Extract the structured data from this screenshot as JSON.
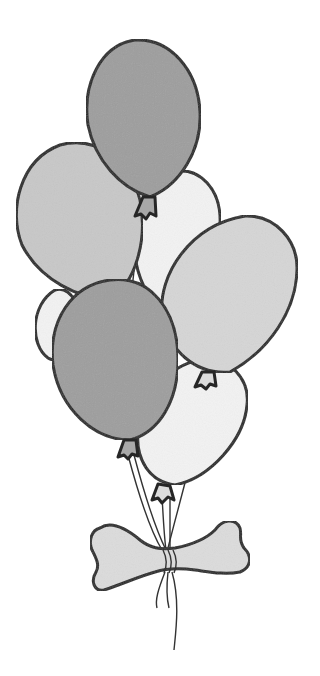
{
  "illustration": {
    "subject": "balloon bunch tied with bone-shaped tag",
    "style": "grayscale watercolor line drawing",
    "colors": {
      "background": "#ffffff",
      "outline": "#262626",
      "dark_balloon": "#9e9e9e",
      "medium_balloon": "#c8c8c8",
      "light_balloon": "#d6d6d6",
      "pale_balloon": "#f3f3f3",
      "bone": "#dcdcdc"
    },
    "balloons": [
      {
        "name": "back-left-pale-balloon",
        "tone": "pale_balloon"
      },
      {
        "name": "back-right-pale-balloon",
        "tone": "pale_balloon"
      },
      {
        "name": "lower-right-pale-balloon",
        "tone": "pale_balloon"
      },
      {
        "name": "left-medium-balloon",
        "tone": "medium_balloon"
      },
      {
        "name": "top-dark-balloon",
        "tone": "dark_balloon"
      },
      {
        "name": "right-light-balloon",
        "tone": "light_balloon"
      },
      {
        "name": "front-dark-balloon",
        "tone": "dark_balloon"
      }
    ],
    "bone_tag": {
      "name": "bone-tag",
      "tone": "bone"
    }
  }
}
